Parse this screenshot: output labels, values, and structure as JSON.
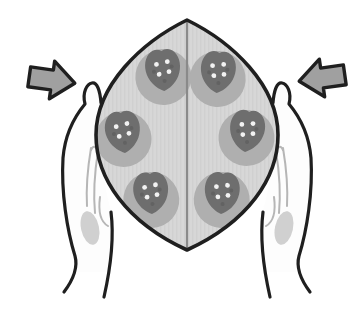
{
  "colors": {
    "background": "#ffffff",
    "outline": "#1f1f1f",
    "dough": "#d7d7d7",
    "fold_line": "#8a8a8a",
    "spot_halo": "#afafaf",
    "berry": "#6e6e6e",
    "berry_speck": "#5a5a5a",
    "seed": "#f2f2f2",
    "arrow_fill": "#a0a0a0",
    "hand_fill": "#fdfdfd",
    "finger_line": "#b6b6b6",
    "palm_shadow": "#c4c4c4"
  },
  "spots": [
    {
      "x": 163,
      "y": 72,
      "tilt": -4
    },
    {
      "x": 218,
      "y": 74,
      "tilt": 4
    },
    {
      "x": 123,
      "y": 134,
      "tilt": -6
    },
    {
      "x": 247,
      "y": 133,
      "tilt": 6
    },
    {
      "x": 151,
      "y": 195,
      "tilt": -3
    },
    {
      "x": 222,
      "y": 195,
      "tilt": 3
    }
  ],
  "arrows": [
    {
      "side": "left",
      "points_toward": "right"
    },
    {
      "side": "right",
      "points_toward": "left"
    }
  ]
}
